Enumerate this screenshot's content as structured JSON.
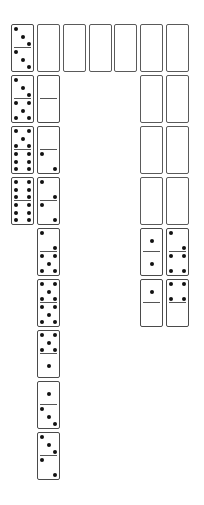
{
  "game": {
    "name": "domino-solitaire",
    "colors": {
      "background": "#ffffff",
      "border": "#4a4a4a",
      "pip": "#111111"
    },
    "layout": {
      "column_x": [
        11,
        37,
        63,
        89,
        114,
        140,
        166
      ],
      "top_y": 24,
      "domino_pitch": 51,
      "domino_width": 23,
      "domino_height": 48
    },
    "columns": [
      {
        "index": 1,
        "dominoes": [
          {
            "top": 3,
            "bottom": 3,
            "face_up": true
          },
          {
            "top": 3,
            "bottom": 5,
            "face_up": true
          },
          {
            "top": 5,
            "bottom": 6,
            "face_up": true
          },
          {
            "top": 6,
            "bottom": 6,
            "face_up": true
          }
        ]
      },
      {
        "index": 2,
        "dominoes": [
          {
            "face_up": false
          },
          {
            "top": 0,
            "bottom": 0,
            "face_up": true
          },
          {
            "top": 0,
            "bottom": 2,
            "face_up": true
          },
          {
            "top": 2,
            "bottom": 2,
            "face_up": true
          },
          {
            "top": 2,
            "bottom": 5,
            "face_up": true
          },
          {
            "top": 5,
            "bottom": 5,
            "face_up": true
          },
          {
            "top": 5,
            "bottom": 1,
            "face_up": true
          },
          {
            "top": 1,
            "bottom": 3,
            "face_up": true
          },
          {
            "top": 3,
            "bottom": 2,
            "face_up": true
          }
        ]
      },
      {
        "index": 3,
        "dominoes": [
          {
            "face_up": false
          }
        ]
      },
      {
        "index": 4,
        "dominoes": [
          {
            "face_up": false
          }
        ]
      },
      {
        "index": 5,
        "dominoes": [
          {
            "face_up": false
          }
        ]
      },
      {
        "index": 6,
        "dominoes": [
          {
            "face_up": false
          },
          {
            "face_up": false
          },
          {
            "face_up": false
          },
          {
            "face_up": false
          },
          {
            "top": 1,
            "bottom": 1,
            "face_up": true
          },
          {
            "top": 1,
            "bottom": 0,
            "face_up": true
          }
        ]
      },
      {
        "index": 7,
        "dominoes": [
          {
            "face_up": false
          },
          {
            "face_up": false
          },
          {
            "face_up": false
          },
          {
            "face_up": false
          },
          {
            "top": 2,
            "bottom": 4,
            "face_up": true
          },
          {
            "top": 4,
            "bottom": 0,
            "face_up": true
          }
        ]
      }
    ]
  }
}
